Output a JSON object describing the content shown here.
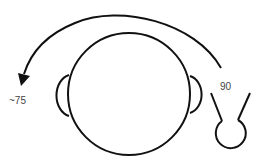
{
  "diagram": {
    "labels": {
      "start_angle": "90",
      "end_angle": "~75"
    },
    "colors": {
      "stroke": "#111111",
      "text": "#444444",
      "background": "#ffffff"
    },
    "icons": {
      "head": "head-circle",
      "ears": "ear-shapes",
      "arrow": "curved-arrow",
      "sensor": "microphone-icon"
    }
  }
}
